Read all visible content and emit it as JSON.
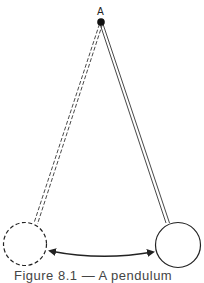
{
  "diagram": {
    "pivot": {
      "label": "A",
      "x": 101,
      "y": 22
    },
    "bob_left": {
      "x": 25,
      "y": 244,
      "r": 22,
      "style": "dashed"
    },
    "bob_right": {
      "x": 178,
      "y": 245,
      "r": 23,
      "style": "solid"
    },
    "arrow": {
      "from": [
        49,
        251
      ],
      "to": [
        154,
        252
      ],
      "type": "double-headed"
    },
    "stroke_color": "#222222"
  },
  "caption": {
    "text": "Figure 8.1 — A pendulum"
  }
}
